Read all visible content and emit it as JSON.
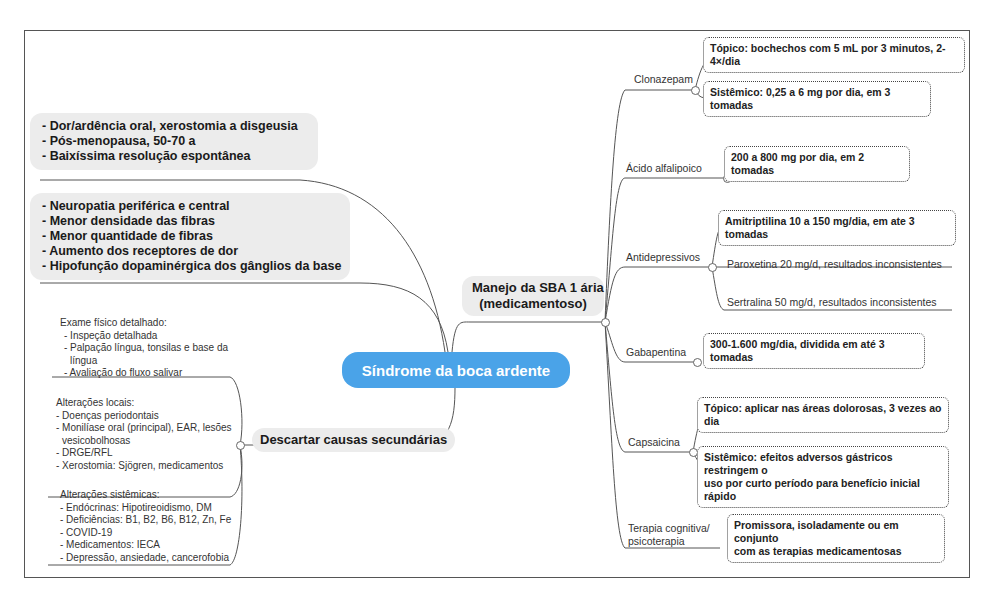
{
  "central": {
    "label": "Síndrome da boca ardente",
    "color": "#4aa3e8"
  },
  "left": {
    "clinical_box": {
      "lines": [
        "- Dor/ardência oral, xerostomia a disgeusia",
        "- Pós-menopausa, 50-70 a",
        "- Baixíssima resolução espontânea"
      ]
    },
    "pathophysiology_box": {
      "lines": [
        "- Neuropatia periférica e central",
        "- Menor densidade das fibras",
        "- Menor quantidade de fibras",
        "- Aumento dos receptores de dor",
        "- Hipofunção dopaminérgica dos gânglios da base"
      ]
    },
    "secondary": {
      "title": "Descartar causas secundárias",
      "groups": [
        {
          "lines": [
            "Exame físico detalhado:",
            "- Inspeção detalhada",
            "- Palpação língua, tonsilas e base da",
            "  língua",
            "- Avaliação do fluxo salivar"
          ]
        },
        {
          "lines": [
            "Alterações locais:",
            "- Doenças periodontais",
            "- Monilíase oral (principal), EAR, lesões",
            "  vesicobolhosas",
            "- DRGE/RFL",
            "- Xerostomia: Sjögren, medicamentos"
          ]
        },
        {
          "lines": [
            "Alterações sistêmicas:",
            "- Endócrinas: Hipotireoidismo, DM",
            "- Deficiências: B1, B2, B6, B12, Zn, Fe",
            "- COVID-19",
            "- Medicamentos: IECA",
            "- Depressão, ansiedade, cancerofobia"
          ]
        }
      ]
    }
  },
  "right": {
    "title_line1": "Manejo da SBA 1 ária",
    "title_line2": "(medicamentoso)",
    "drugs": [
      {
        "name": "Clonazepam",
        "items": [
          {
            "text": "Tópico: bochechos com 5 mL por 3 minutos, 2-4×/dia",
            "style": "dotted"
          },
          {
            "text": "Sistêmico: 0,25 a 6 mg por dia, em 3 tomadas",
            "style": "dotted"
          }
        ]
      },
      {
        "name": "Ácido alfalipoico",
        "items": [
          {
            "text": "200 a 800 mg por dia, em 2 tomadas",
            "style": "dotted"
          }
        ]
      },
      {
        "name": "Antidepressivos",
        "items": [
          {
            "text": "Amitriptilina 10 a 150 mg/dia, em ate 3 tomadas",
            "style": "dotted"
          },
          {
            "text": "Paroxetina 20 mg/d, resultados inconsistentes",
            "style": "plain"
          },
          {
            "text": "Sertralina 50 mg/d, resultados inconsistentes",
            "style": "plain"
          }
        ]
      },
      {
        "name": "Gabapentina",
        "items": [
          {
            "text": "300-1.600 mg/dia, dividida em até 3 tomadas",
            "style": "dotted"
          }
        ]
      },
      {
        "name": "Capsaicina",
        "items": [
          {
            "text": "Tópico: aplicar nas áreas dolorosas, 3 vezes ao dia",
            "style": "dotted"
          },
          {
            "text_line1": "Sistêmico: efeitos adversos gástricos restringem o",
            "text_line2": "uso por curto período para benefício inicial rápido",
            "style": "dotted"
          }
        ]
      },
      {
        "name_line1": "Terapia cognitiva/",
        "name_line2": "psicoterapia",
        "items": [
          {
            "text_line1": "Promissora, isoladamente ou em conjunto",
            "text_line2": "com as terapias medicamentosas",
            "style": "dotted"
          }
        ]
      }
    ]
  }
}
